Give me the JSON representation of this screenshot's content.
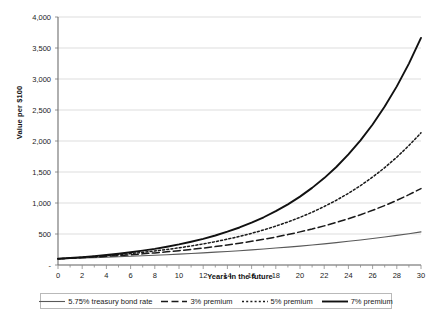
{
  "chart_data": {
    "type": "line",
    "title": "",
    "xlabel": "Years in the future",
    "ylabel": "Value per $100",
    "xlim": [
      0,
      30
    ],
    "ylim": [
      0,
      4000
    ],
    "grid": true,
    "legend_position": "bottom",
    "x_tick_labels": [
      "0",
      "2",
      "4",
      "6",
      "8",
      "10",
      "12",
      "14",
      "16",
      "18",
      "20",
      "22",
      "24",
      "26",
      "28",
      "30"
    ],
    "x_ticks": [
      0,
      2,
      4,
      6,
      8,
      10,
      12,
      14,
      16,
      18,
      20,
      22,
      24,
      26,
      28,
      30
    ],
    "y_tick_labels": [
      "-",
      "500",
      "1,000",
      "1,500",
      "2,000",
      "2,500",
      "3,000",
      "3,500",
      "4,000"
    ],
    "y_ticks": [
      0,
      500,
      1000,
      1500,
      2000,
      2500,
      3000,
      3500,
      4000
    ],
    "x": [
      0,
      1,
      2,
      3,
      4,
      5,
      6,
      7,
      8,
      9,
      10,
      11,
      12,
      13,
      14,
      15,
      16,
      17,
      18,
      19,
      20,
      21,
      22,
      23,
      24,
      25,
      26,
      27,
      28,
      29,
      30
    ],
    "series": [
      {
        "name": "5.75% treasury bond rate",
        "rate_percent": 5.75,
        "style": "solid-thin",
        "color": "#595959",
        "values": [
          100,
          106,
          112,
          118,
          125,
          132,
          140,
          148,
          157,
          165,
          175,
          185,
          195,
          207,
          218,
          231,
          244,
          258,
          273,
          289,
          305,
          323,
          341,
          361,
          382,
          404,
          427,
          452,
          478,
          505,
          534
        ]
      },
      {
        "name": "3% premium",
        "rate_percent": 8.75,
        "style": "dashed",
        "color": "#1a1a1a",
        "values": [
          100,
          109,
          118,
          128,
          140,
          152,
          165,
          180,
          195,
          212,
          231,
          251,
          273,
          297,
          323,
          351,
          382,
          415,
          451,
          491,
          534,
          580,
          631,
          686,
          746,
          811,
          882,
          959,
          1043,
          1134,
          1233
        ]
      },
      {
        "name": "5% premium",
        "rate_percent": 10.75,
        "style": "dotted",
        "color": "#1a1a1a",
        "values": [
          100,
          111,
          123,
          136,
          150,
          166,
          184,
          204,
          226,
          250,
          277,
          307,
          340,
          376,
          417,
          461,
          511,
          566,
          627,
          694,
          769,
          851,
          943,
          1044,
          1156,
          1280,
          1418,
          1570,
          1739,
          1926,
          2132
        ]
      },
      {
        "name": "7% premium",
        "rate_percent": 12.75,
        "style": "solid-thick",
        "color": "#111111",
        "values": [
          100,
          113,
          127,
          143,
          162,
          182,
          206,
          232,
          261,
          295,
          332,
          375,
          422,
          476,
          537,
          605,
          683,
          770,
          868,
          978,
          1103,
          1244,
          1402,
          1581,
          1783,
          2010,
          2266,
          2555,
          2881,
          3248,
          3662
        ]
      }
    ]
  },
  "legend": {
    "items": [
      {
        "label": "5.75% treasury bond rate",
        "swatch": "solid-thin-swatch"
      },
      {
        "label": "3% premium",
        "swatch": "dashed-swatch"
      },
      {
        "label": "5% premium",
        "swatch": "dotted-swatch"
      },
      {
        "label": "7% premium",
        "swatch": "solid-thick-swatch"
      }
    ]
  },
  "colors": {
    "grid": "#d4d4d4",
    "axis": "#8a8a8a",
    "text": "#1a1a1a",
    "background": "#ffffff"
  }
}
